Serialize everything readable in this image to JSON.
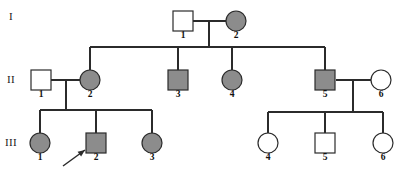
{
  "figure": {
    "type": "pedigree-chart",
    "width": 401,
    "height": 174,
    "background": "#ffffff",
    "line_color": "#2b2b2b",
    "affected_fill": "#8c8c8c",
    "unaffected_fill": "#ffffff"
  },
  "generations": [
    {
      "label": "I",
      "x": 11,
      "y": 17
    },
    {
      "label": "II",
      "x": 11,
      "y": 80
    },
    {
      "label": "III",
      "x": 11,
      "y": 143
    }
  ],
  "individuals": [
    {
      "id": "I-1",
      "number": "1",
      "sex": "male",
      "shape": "square",
      "affected": false,
      "cx": 183,
      "cy": 21,
      "label_x": 183,
      "label_y": 36
    },
    {
      "id": "I-2",
      "number": "2",
      "sex": "female",
      "shape": "circle",
      "affected": true,
      "cx": 236,
      "cy": 21,
      "label_x": 236,
      "label_y": 36
    },
    {
      "id": "II-1",
      "number": "1",
      "sex": "male",
      "shape": "square",
      "affected": false,
      "cx": 41,
      "cy": 80,
      "label_x": 41,
      "label_y": 95
    },
    {
      "id": "II-2",
      "number": "2",
      "sex": "female",
      "shape": "circle",
      "affected": true,
      "cx": 90,
      "cy": 80,
      "label_x": 90,
      "label_y": 95
    },
    {
      "id": "II-3",
      "number": "3",
      "sex": "male",
      "shape": "square",
      "affected": true,
      "cx": 178,
      "cy": 80,
      "label_x": 178,
      "label_y": 95
    },
    {
      "id": "II-4",
      "number": "4",
      "sex": "female",
      "shape": "circle",
      "affected": true,
      "cx": 232,
      "cy": 80,
      "label_x": 232,
      "label_y": 95
    },
    {
      "id": "II-5",
      "number": "5",
      "sex": "male",
      "shape": "square",
      "affected": true,
      "cx": 325,
      "cy": 80,
      "label_x": 325,
      "label_y": 95
    },
    {
      "id": "II-6",
      "number": "6",
      "sex": "female",
      "shape": "circle",
      "affected": false,
      "cx": 381,
      "cy": 80,
      "label_x": 381,
      "label_y": 95
    },
    {
      "id": "III-1",
      "number": "1",
      "sex": "female",
      "shape": "circle",
      "affected": true,
      "cx": 40,
      "cy": 143,
      "label_x": 40,
      "label_y": 158
    },
    {
      "id": "III-2",
      "number": "2",
      "sex": "male",
      "shape": "square",
      "affected": true,
      "cx": 96,
      "cy": 143,
      "label_x": 96,
      "label_y": 158
    },
    {
      "id": "III-3",
      "number": "3",
      "sex": "female",
      "shape": "circle",
      "affected": true,
      "cx": 152,
      "cy": 143,
      "label_x": 152,
      "label_y": 158
    },
    {
      "id": "III-4",
      "number": "4",
      "sex": "female",
      "shape": "circle",
      "affected": false,
      "cx": 268,
      "cy": 143,
      "label_x": 268,
      "label_y": 158
    },
    {
      "id": "III-5",
      "number": "5",
      "sex": "male",
      "shape": "square",
      "affected": false,
      "cx": 325,
      "cy": 143,
      "label_x": 325,
      "label_y": 158
    },
    {
      "id": "III-6",
      "number": "6",
      "sex": "female",
      "shape": "circle",
      "affected": false,
      "cx": 383,
      "cy": 143,
      "label_x": 383,
      "label_y": 158
    }
  ],
  "proband": {
    "target": "III-2",
    "arrow_from_x": 63,
    "arrow_from_y": 166,
    "arrow_to_x": 85,
    "arrow_to_y": 150
  },
  "connections": {
    "mating_lines": [
      {
        "name": "I-1 x I-2",
        "x1": 193,
        "y1": 21,
        "x2": 226,
        "y2": 21
      },
      {
        "name": "II-1 x II-2",
        "x1": 51,
        "y1": 80,
        "x2": 80,
        "y2": 80
      },
      {
        "name": "II-5 x II-6",
        "x1": 336,
        "y1": 80,
        "x2": 371,
        "y2": 80
      }
    ],
    "descent_lines": [
      {
        "name": "I couple drop",
        "x1": 209,
        "y1": 21,
        "x2": 209,
        "y2": 47
      },
      {
        "name": "II-1 couple drop",
        "x1": 66,
        "y1": 80,
        "x2": 66,
        "y2": 110
      },
      {
        "name": "II-5 couple drop",
        "x1": 353,
        "y1": 80,
        "x2": 353,
        "y2": 112
      }
    ],
    "sibship_lines": [
      {
        "name": "generation II sibship",
        "x1": 90,
        "y1": 47,
        "x2": 325,
        "y2": 47
      },
      {
        "name": "generation III left sibship",
        "x1": 40,
        "y1": 110,
        "x2": 152,
        "y2": 110
      },
      {
        "name": "generation III right sibship",
        "x1": 268,
        "y1": 112,
        "x2": 383,
        "y2": 112
      }
    ],
    "child_drops": [
      {
        "name": "drop to II-2",
        "x1": 90,
        "y1": 47,
        "x2": 90,
        "y2": 70
      },
      {
        "name": "drop to II-3",
        "x1": 178,
        "y1": 47,
        "x2": 178,
        "y2": 70
      },
      {
        "name": "drop to II-4",
        "x1": 232,
        "y1": 47,
        "x2": 232,
        "y2": 70
      },
      {
        "name": "drop to II-5",
        "x1": 325,
        "y1": 47,
        "x2": 325,
        "y2": 70
      },
      {
        "name": "drop to III-1",
        "x1": 40,
        "y1": 110,
        "x2": 40,
        "y2": 134
      },
      {
        "name": "drop to III-2",
        "x1": 96,
        "y1": 110,
        "x2": 96,
        "y2": 134
      },
      {
        "name": "drop to III-3",
        "x1": 152,
        "y1": 110,
        "x2": 152,
        "y2": 134
      },
      {
        "name": "drop to III-4",
        "x1": 268,
        "y1": 112,
        "x2": 268,
        "y2": 134
      },
      {
        "name": "drop to III-5",
        "x1": 325,
        "y1": 112,
        "x2": 325,
        "y2": 134
      },
      {
        "name": "drop to III-6",
        "x1": 383,
        "y1": 112,
        "x2": 383,
        "y2": 134
      }
    ]
  }
}
